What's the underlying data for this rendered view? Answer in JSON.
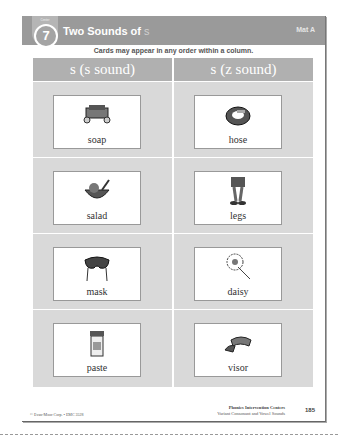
{
  "header": {
    "center_label": "Center",
    "center_number": "7",
    "title_prefix": "Two Sounds of",
    "title_letter": "s",
    "mat_label": "Mat A"
  },
  "instructions": "Cards may appear in any order within a column.",
  "columns": [
    {
      "heading": "s (s sound)",
      "cards": [
        "soap",
        "salad",
        "mask",
        "paste"
      ]
    },
    {
      "heading": "s (z sound)",
      "cards": [
        "hose",
        "legs",
        "daisy",
        "visor"
      ]
    }
  ],
  "footer": {
    "copyright": "© Evan-Moor Corp. • EMC 3528",
    "series_title": "Phonics Intervention Centers",
    "series_subtitle": "Variant Consonant and Vowel Sounds",
    "page_number": "185"
  },
  "colors": {
    "header_band": "#9a9a9a",
    "column_head": "#b0b0b0",
    "cell_bg": "#d9d9d9"
  }
}
